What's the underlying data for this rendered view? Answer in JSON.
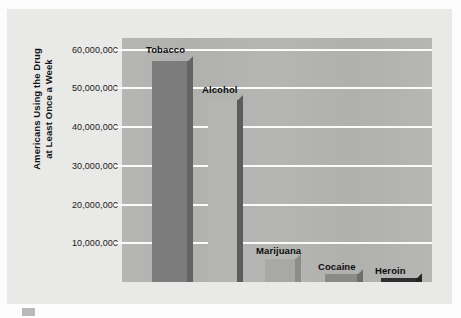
{
  "chart_data": {
    "type": "bar",
    "title": "",
    "xlabel": "",
    "ylabel": "Americans Using the Drug at Least Once a Week",
    "ylabel_line1": "Americans Using the Drug",
    "ylabel_line2": "at Least Once a Week",
    "categories": [
      "Tobacco",
      "Alcohol",
      "Marijuana",
      "Cocaine",
      "Heroin"
    ],
    "values": [
      57000000,
      47000000,
      6000000,
      2000000,
      1000000
    ],
    "value_labels": [
      "",
      "",
      "",
      "",
      ""
    ],
    "ylim": [
      0,
      63000000
    ],
    "yticks": [
      10000000,
      20000000,
      30000000,
      40000000,
      50000000,
      60000000
    ],
    "ytick_labels": [
      "10,000,000",
      "20,000,000",
      "30,000,000",
      "40,000,000",
      "50,000,000",
      "60,000,000"
    ],
    "grid": true,
    "gridline_color": "#fbfbfa",
    "legend": null,
    "plot_background": "#b2b2b0",
    "figure_background": "#e9e9e7",
    "bar_colors": [
      "#7c7c7c",
      "#b4b4b2",
      "#a8a8a6",
      "#8a8a88",
      "#2e2e2e"
    ],
    "bar_side_colors": [
      "#636363",
      "#5c5c5c",
      "#8c8c8a",
      "#6e6e6c",
      "#242424"
    ],
    "bars": [
      {
        "label": "Tobacco",
        "value": 57000000,
        "label_x": 146,
        "label_y": 44
      },
      {
        "label": "Alcohol",
        "value": 47000000,
        "label_x": 202,
        "label_y": 84
      },
      {
        "label": "Marijuana",
        "value": 6000000,
        "label_x": 256,
        "label_y": 245
      },
      {
        "label": "Cocaine",
        "value": 2000000,
        "label_x": 318,
        "label_y": 261
      },
      {
        "label": "Heroin",
        "value": 1000000,
        "label_x": 375,
        "label_y": 265
      }
    ]
  }
}
